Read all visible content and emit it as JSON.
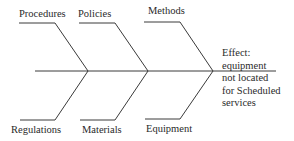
{
  "diagram": {
    "type": "fishbone",
    "causes_top": [
      {
        "label": "Procedures"
      },
      {
        "label": "Policies"
      },
      {
        "label": "Methods"
      }
    ],
    "causes_bottom": [
      {
        "label": "Regulations"
      },
      {
        "label": "Materials"
      },
      {
        "label": "Equipment"
      }
    ],
    "effect": {
      "lines": [
        "Effect:",
        "equipment",
        "not located",
        "for Scheduled",
        "services"
      ]
    },
    "colors": {
      "line": "#3a3a3a",
      "text": "#2a2a2a",
      "background": "#ffffff"
    }
  }
}
